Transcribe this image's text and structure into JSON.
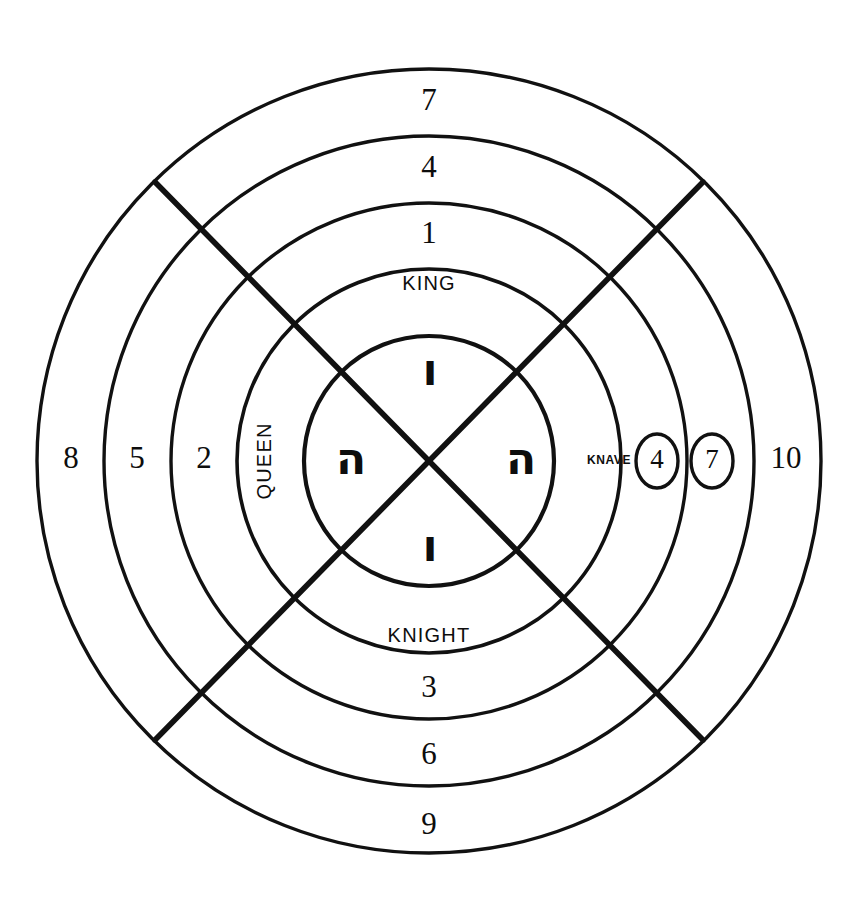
{
  "figure": {
    "background_color": "#ffffff",
    "ink_color": "#111111",
    "center": {
      "x": 429,
      "y": 461
    },
    "ring_radii": [
      392,
      325,
      258,
      192,
      125
    ],
    "ring_count": 5,
    "cross": {
      "type": "diagonal-x",
      "endpoints": [
        {
          "x1": 155,
          "y1": 182,
          "x2": 703,
          "y2": 740
        },
        {
          "x1": 703,
          "y1": 182,
          "x2": 155,
          "y2": 740
        }
      ]
    }
  },
  "labels": {
    "top": [
      {
        "text": "7",
        "radius": 358,
        "kind": "number"
      },
      {
        "text": "4",
        "radius": 291,
        "kind": "number"
      },
      {
        "text": "1",
        "radius": 225,
        "kind": "number"
      },
      {
        "text": "KING",
        "radius": 160,
        "kind": "court"
      }
    ],
    "bottom": [
      {
        "text": "KNIGHT",
        "radius": 160,
        "kind": "court"
      },
      {
        "text": "3",
        "radius": 225,
        "kind": "number"
      },
      {
        "text": "6",
        "radius": 291,
        "kind": "number"
      },
      {
        "text": "9",
        "radius": 358,
        "kind": "number"
      }
    ],
    "left": [
      {
        "text": "QUEEN",
        "radius": 160,
        "kind": "court-rotated"
      },
      {
        "text": "2",
        "radius": 225,
        "kind": "number"
      },
      {
        "text": "5",
        "radius": 291,
        "kind": "number"
      },
      {
        "text": "8",
        "radius": 358,
        "kind": "number"
      }
    ],
    "right": [
      {
        "text": "KNAVE",
        "radius": 160,
        "kind": "court-small"
      },
      {
        "text": "4",
        "radius": 225,
        "kind": "number-ringed"
      },
      {
        "text": "7",
        "radius": 291,
        "kind": "number-ringed"
      },
      {
        "text": "10",
        "radius": 358,
        "kind": "number"
      }
    ],
    "center_hebrew": [
      {
        "text": "ו",
        "position": "top",
        "transliteration": "vav"
      },
      {
        "text": "ה",
        "position": "left",
        "transliteration": "he"
      },
      {
        "text": "ה",
        "position": "right",
        "transliteration": "he"
      },
      {
        "text": "ו",
        "position": "bottom",
        "transliteration": "vav"
      }
    ]
  }
}
